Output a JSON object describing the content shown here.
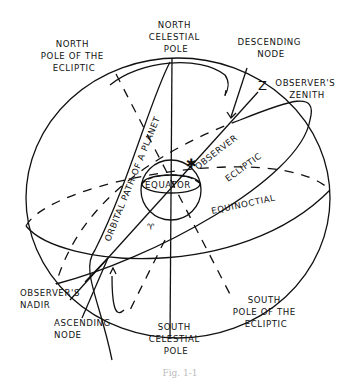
{
  "diagram": {
    "labels": {
      "north_celestial_pole": [
        "NORTH",
        "CELESTIAL",
        "POLE"
      ],
      "north_pole_ecliptic": [
        "NORTH",
        "POLE OF THE",
        "ECLIPTIC"
      ],
      "descending_node": [
        "DESCENDING",
        "NODE"
      ],
      "zenith_letter": "Z",
      "observers_zenith": [
        "OBSERVER'S",
        "ZENITH"
      ],
      "orbital_path": "ORBITAL PATH OF A PLANET",
      "observer": "OBSERVER",
      "ecliptic": "ECLIPTIC",
      "equator": "EQUATOR",
      "equinoctial": "EQUINOCTIAL",
      "vernal_equinox_symbol": "♈",
      "observers_nadir": [
        "OBSERVER'S",
        "NADIR"
      ],
      "ascending_node": [
        "ASCENDING",
        "NODE"
      ],
      "south_celestial_pole": [
        "SOUTH",
        "CELESTIAL",
        "POLE"
      ],
      "south_pole_ecliptic": [
        "SOUTH",
        "POLE OF THE",
        "ECLIPTIC"
      ]
    },
    "caption": "Fig. 1-1"
  }
}
